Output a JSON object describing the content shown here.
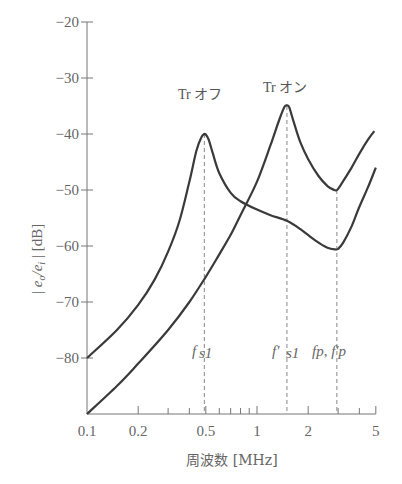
{
  "chart_data": {
    "type": "line",
    "title": "",
    "xlabel": "周波数 [MHz]",
    "ylabel": "| e_o / e_i | [dB]",
    "x_scale": "log",
    "xlim": [
      0.1,
      5
    ],
    "ylim": [
      -90,
      -20
    ],
    "grid": false,
    "x_ticks": [
      0.1,
      0.2,
      0.5,
      1,
      2,
      5
    ],
    "x_tick_labels": [
      "0.1",
      "0.2",
      "0.5",
      "1",
      "2",
      "5"
    ],
    "x_minor_ticks": [
      0.3,
      0.4,
      0.6,
      0.7,
      0.8,
      0.9,
      3,
      4
    ],
    "y_ticks": [
      -20,
      -30,
      -40,
      -50,
      -60,
      -70,
      -80
    ],
    "y_tick_labels": [
      "−20",
      "−30",
      "−40",
      "−50",
      "−60",
      "−70",
      "−80"
    ],
    "series": [
      {
        "name": "Tr オフ",
        "x": [
          0.1,
          0.15,
          0.2,
          0.25,
          0.3,
          0.35,
          0.4,
          0.44,
          0.47,
          0.49,
          0.5,
          0.52,
          0.55,
          0.6,
          0.7,
          0.8,
          1.0,
          1.2,
          1.5,
          1.8,
          2.2,
          2.6,
          2.9,
          3.0,
          3.2,
          3.6,
          4.0,
          4.5,
          5.0
        ],
        "values": [
          -80,
          -75,
          -70.5,
          -66,
          -61,
          -55.5,
          -48.5,
          -43,
          -40.6,
          -40.0,
          -40.1,
          -41,
          -43.5,
          -47,
          -50.5,
          -52,
          -53.5,
          -54.5,
          -55.5,
          -57,
          -59,
          -60.3,
          -60.6,
          -60.5,
          -59.5,
          -56.5,
          -53,
          -49.5,
          -46
        ]
      },
      {
        "name": "Tr オン",
        "x": [
          0.1,
          0.15,
          0.2,
          0.3,
          0.4,
          0.5,
          0.6,
          0.7,
          0.8,
          1.0,
          1.2,
          1.35,
          1.45,
          1.5,
          1.55,
          1.65,
          1.8,
          2.0,
          2.3,
          2.6,
          2.85,
          2.95,
          3.0,
          3.2,
          3.6,
          4.0,
          4.5,
          4.9
        ],
        "values": [
          -90,
          -85,
          -81,
          -75,
          -70,
          -65.5,
          -61.5,
          -58,
          -54.5,
          -48.5,
          -42,
          -37.5,
          -35.2,
          -34.9,
          -35.3,
          -38,
          -41.5,
          -44.5,
          -47.5,
          -49.3,
          -50.0,
          -50.0,
          -49.8,
          -48.5,
          -46,
          -43.5,
          -41,
          -39.5
        ]
      }
    ],
    "markers": [
      {
        "label": "f_s1",
        "x": 0.49
      },
      {
        "label": "f'_s1",
        "x": 1.5
      },
      {
        "label": "f_p, f'_p",
        "x": 2.95
      }
    ],
    "annotations": [
      {
        "text": "Tr オフ",
        "x": 0.49,
        "y": -37
      },
      {
        "text": "Tr オン",
        "x": 1.5,
        "y": -31.5
      }
    ],
    "legend": "none (inline curve labels)"
  },
  "labels": {
    "x_axis_title": "周波数 [MHz]",
    "y_axis_title_main": "| e",
    "y_axis_sub_o": "o",
    "y_axis_slash": "/e",
    "y_axis_sub_i": "i",
    "y_axis_unit": " | [dB]",
    "curve_off": "Tr オフ",
    "curve_on": "Tr オン",
    "marker_fs1_f": "f",
    "marker_fs1_sub": "s1",
    "marker_fps1_f": "f′",
    "marker_fps1_sub": "s1",
    "marker_fp": "fp, f′p"
  },
  "colors": {
    "curve": "#3a3a3a",
    "axis": "#777777",
    "text": "#666666",
    "dashed": "#888888"
  }
}
